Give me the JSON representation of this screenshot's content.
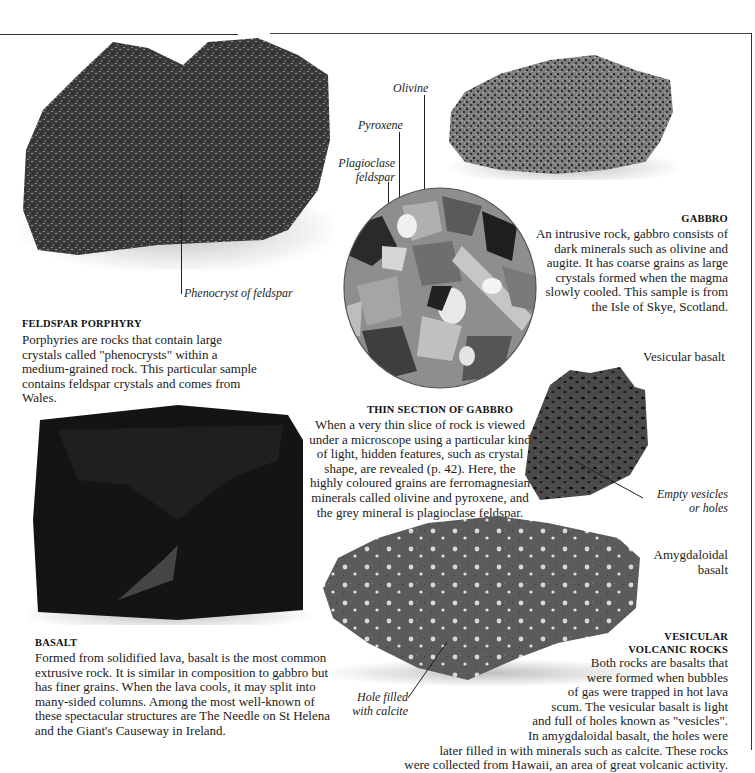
{
  "specimens": {
    "feldspar_porphyry": {
      "heading": "FELDSPAR PORPHYRY",
      "body": "Porphyries are rocks that contain large crystals called \"phenocrysts\" within a medium-grained rock. This particular sample contains feldspar crystals and comes from Wales.",
      "callout": "Phenocryst of feldspar"
    },
    "gabbro": {
      "heading": "GABBRO",
      "body_lines": [
        "An intrusive rock, gabbro consists of",
        "dark minerals such as olivine and",
        "augite. It has coarse grains as large",
        "crystals formed when the magma",
        "slowly cooled. This sample is from",
        "the Isle of Skye, Scotland."
      ]
    },
    "thin_section": {
      "heading": "THIN SECTION OF GABBRO",
      "body_lines": [
        "When a very thin slice of rock is viewed",
        "under a microscope using a particular kind",
        "of light, hidden features, such as crystal",
        "shape, are revealed (p. 42). Here, the",
        "highly coloured grains are ferromagnesian",
        "minerals called olivine and pyroxene, and",
        "the grey mineral is plagioclase feldspar."
      ],
      "callouts": {
        "olivine": "Olivine",
        "pyroxene": "Pyroxene",
        "plagioclase_1": "Plagioclase",
        "plagioclase_2": "feldspar"
      }
    },
    "basalt": {
      "heading": "BASALT",
      "body_lines": [
        "Formed from solidified lava, basalt is the most common",
        "extrusive rock. It is similar  in composition to gabbro but",
        "has finer grains. When the lava cools, it may split into",
        "many-sided columns. Among the most well-known of",
        "these spectacular structures are The Needle on St Helena",
        "and the Giant's Causeway in Ireland."
      ]
    },
    "vesicular_basalt": {
      "label": "Vesicular basalt",
      "callout_1": "Empty vesicles",
      "callout_2": "or holes"
    },
    "amygdaloidal_basalt": {
      "label_1": "Amygdaloidal",
      "label_2": "basalt",
      "callout_1": "Hole filled",
      "callout_2": "with calcite"
    },
    "vesicular_volcanic": {
      "heading_1": "VESICULAR",
      "heading_2": "VOLCANIC ROCKS",
      "body_lines": [
        "Both rocks are basalts that",
        "were formed when bubbles",
        "of gas were trapped in hot lava",
        "scum. The vesicular basalt is light",
        "and full of holes known as \"vesicles\".",
        "In amygdaloidal basalt, the holes were",
        "later filled in with minerals such as calcite. These rocks",
        "were collected from Hawaii, an area of great volcanic activity."
      ]
    }
  }
}
